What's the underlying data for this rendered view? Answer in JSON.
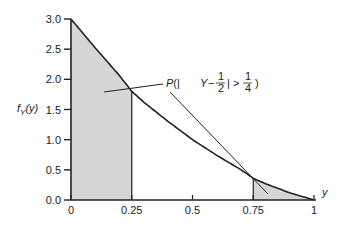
{
  "chart_data": {
    "type": "area",
    "title": "",
    "xlabel": "y",
    "ylabel": "f_Y(y)",
    "xlim": [
      0,
      1
    ],
    "ylim": [
      0,
      3.0
    ],
    "x_ticks": [
      "0",
      "0.25",
      "0.5",
      "0.75",
      "1"
    ],
    "y_ticks": [
      "0.0",
      "0.5",
      "1.0",
      "1.5",
      "2.0",
      "2.5",
      "3.0"
    ],
    "grid": false,
    "curve": {
      "name": "f_Y(y)",
      "x": [
        0,
        0.1,
        0.2,
        0.25,
        0.3,
        0.4,
        0.5,
        0.6,
        0.7,
        0.75,
        0.8,
        0.9,
        1.0
      ],
      "y": [
        3.0,
        2.52,
        2.06,
        1.8,
        1.62,
        1.3,
        1.0,
        0.74,
        0.5,
        0.36,
        0.27,
        0.12,
        0.0
      ]
    },
    "shaded_regions": [
      {
        "from": 0,
        "to": 0.25
      },
      {
        "from": 0.75,
        "to": 1
      }
    ],
    "annotation": {
      "text_prefix": "P(|Y−",
      "frac1_num": "1",
      "frac1_den": "2",
      "text_mid": "| > ",
      "frac2_num": "1",
      "frac2_den": "4",
      "text_suffix": ")"
    }
  },
  "labels": {
    "ylabel_f": "f",
    "ylabel_sub": "Y",
    "ylabel_arg": "(y)",
    "xlabel": "y"
  },
  "colors": {
    "shade": "#d6d6d6",
    "line": "#222222"
  }
}
